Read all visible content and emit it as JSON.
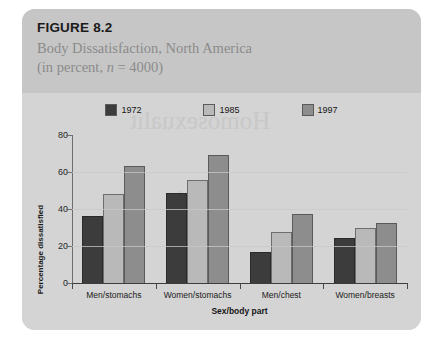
{
  "figure": {
    "number": "FIGURE 8.2",
    "title_line1": "Body Dissatisfaction, North America",
    "title_line2_prefix": "(in percent, ",
    "title_line2_italic": "n",
    "title_line2_suffix": " = 4000)"
  },
  "bleed_through": {
    "line1": "Homosexualit",
    "line2": "A"
  },
  "colors": {
    "panel_background": "#cfcfcf",
    "header_background": "#c6c6c6",
    "plot_background": "#d4d4d4",
    "series_1972": "#3c3c3c",
    "series_1985": "#b9b9b9",
    "series_1997": "#8d8d8d",
    "axis": "#3d3d3d",
    "gridline": "#c9c9c9",
    "title_text": "#8b8b8b"
  },
  "chart_data": {
    "type": "bar",
    "title": "Body Dissatisfaction, North America (in percent, n = 4000)",
    "xlabel": "Sex/body part",
    "ylabel": "Percentage dissatisfied",
    "ylim": [
      0,
      80
    ],
    "yticks": [
      0,
      20,
      40,
      60,
      80
    ],
    "grid": true,
    "legend_position": "top-center",
    "categories": [
      "Men/stomachs",
      "Women/stomachs",
      "Men/chest",
      "Women/breasts"
    ],
    "series": [
      {
        "name": "1972",
        "color": "#3c3c3c",
        "values": [
          36,
          48.5,
          17,
          24.5
        ]
      },
      {
        "name": "1985",
        "color": "#b9b9b9",
        "values": [
          48,
          55.5,
          27.5,
          30
        ]
      },
      {
        "name": "1997",
        "color": "#8d8d8d",
        "values": [
          63.5,
          69,
          37.5,
          32.5
        ]
      }
    ]
  }
}
